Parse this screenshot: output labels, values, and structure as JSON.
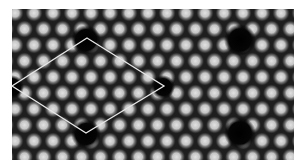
{
  "image": {
    "kind": "atomic-resolution lattice micrograph",
    "frame": {
      "x": 12,
      "y": 9,
      "width": 282,
      "height": 151
    },
    "background_color": "#1a1a1a",
    "spot_color": "#d8d8d8",
    "lattice": {
      "spot_spacing_x": 19,
      "row_spacing_y": 16,
      "spot_radius": 9,
      "origin_x": 3,
      "origin_y": 4
    },
    "large_holes": [
      {
        "cx": 74,
        "cy": 31,
        "r": 15
      },
      {
        "cx": 74,
        "cy": 125,
        "r": 15
      },
      {
        "cx": 228,
        "cy": 31,
        "r": 16
      },
      {
        "cx": 228,
        "cy": 124,
        "r": 16
      },
      {
        "cx": 151,
        "cy": 78,
        "r": 12
      },
      {
        "cx": 0,
        "cy": 78,
        "r": 12
      }
    ]
  },
  "overlay": {
    "shape": "rhombus",
    "stroke_color": "#e6e6e6",
    "stroke_width": 1.3,
    "vertices": {
      "top": [
        87,
        38
      ],
      "right": [
        164,
        86
      ],
      "bottom": [
        86,
        133
      ],
      "left": [
        12,
        86
      ]
    }
  }
}
